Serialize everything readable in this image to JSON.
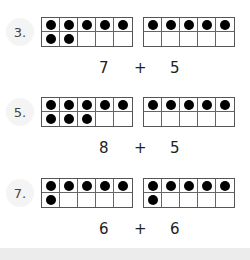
{
  "problems": [
    {
      "label": "3.",
      "left_frame": {
        "filled": 7
      },
      "right_frame": {
        "filled": 5
      },
      "addend_a": "7",
      "operator": "+",
      "addend_b": "5"
    },
    {
      "label": "5.",
      "left_frame": {
        "filled": 8
      },
      "right_frame": {
        "filled": 5
      },
      "addend_a": "8",
      "operator": "+",
      "addend_b": "5"
    },
    {
      "label": "7.",
      "left_frame": {
        "filled": 6
      },
      "right_frame": {
        "filled": 6
      },
      "addend_a": "6",
      "operator": "+",
      "addend_b": "6"
    }
  ],
  "frame": {
    "columns": 5,
    "rows": 2
  },
  "colors": {
    "dot": "#000000",
    "frame_border": "#555555",
    "label": "#444444",
    "badge_bg": "#f4f4f4",
    "footer_band": "#ececec"
  }
}
